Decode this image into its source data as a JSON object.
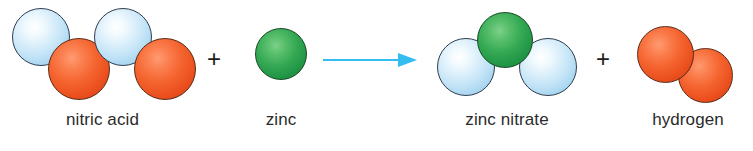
{
  "diagram": {
    "type": "chemical-reaction-equation",
    "title": "",
    "canvas": {
      "width": 753,
      "height": 151,
      "background": "#ffffff"
    },
    "colors": {
      "atom_blue": "#c3e4f7",
      "atom_orange": "#f4632e",
      "atom_green": "#34a853",
      "arrow": "#35bdf0",
      "text": "#2b2b2b",
      "outline": "#2f3d4f"
    },
    "operators": [
      {
        "symbol": "+",
        "name": "plus-sign-1"
      },
      {
        "symbol": "+",
        "name": "plus-sign-2"
      }
    ],
    "arrow": {
      "symbol": "→",
      "direction": "right",
      "color": "#35bdf0"
    },
    "reactants": [
      {
        "id": "nitric-acid",
        "label": "nitric acid",
        "atoms": [
          {
            "color": "blue",
            "x": 12,
            "y": 8,
            "d": 58
          },
          {
            "color": "orange",
            "x": 48,
            "y": 38,
            "d": 62
          },
          {
            "color": "blue",
            "x": 94,
            "y": 8,
            "d": 58
          },
          {
            "color": "orange",
            "x": 134,
            "y": 38,
            "d": 62
          }
        ]
      },
      {
        "id": "zinc",
        "label": "zinc",
        "atoms": [
          {
            "color": "green",
            "x": 255,
            "y": 28,
            "d": 52
          }
        ]
      }
    ],
    "products": [
      {
        "id": "zinc-nitrate",
        "label": "zinc nitrate",
        "atoms": [
          {
            "color": "blue",
            "x": 437,
            "y": 38,
            "d": 58
          },
          {
            "color": "green",
            "x": 477,
            "y": 12,
            "d": 56
          },
          {
            "color": "blue",
            "x": 519,
            "y": 38,
            "d": 58
          }
        ]
      },
      {
        "id": "hydrogen",
        "label": "hydrogen",
        "atoms": [
          {
            "color": "orange",
            "x": 637,
            "y": 26,
            "d": 57
          },
          {
            "color": "orange",
            "x": 678,
            "y": 48,
            "d": 55
          }
        ]
      }
    ],
    "labels": {
      "nitric_acid": "nitric acid",
      "zinc": "zinc",
      "zinc_nitrate": "zinc nitrate",
      "hydrogen": "hydrogen"
    }
  }
}
